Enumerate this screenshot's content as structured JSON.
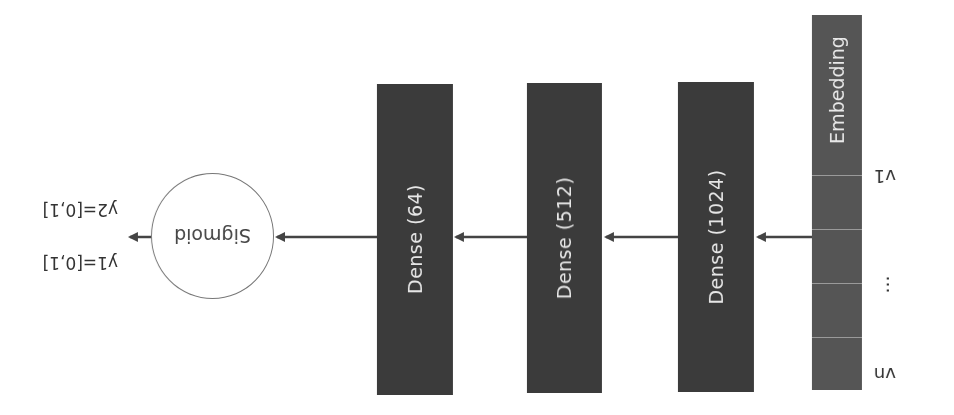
{
  "diagram": {
    "orientation": "rotated-180",
    "input": {
      "label": "Embedding",
      "tokens": [
        "v1",
        "…",
        "vn"
      ]
    },
    "layers": [
      {
        "label": "Dense (1024)"
      },
      {
        "label": "Dense (512)"
      },
      {
        "label": "Dense (64)"
      }
    ],
    "activation": {
      "label": "Sigmoid"
    },
    "outputs": [
      {
        "label": "y1=[0,1]"
      },
      {
        "label": "y2=[0,1]"
      }
    ],
    "colors": {
      "layer_fill": "#3b3b3b",
      "embedding_fill": "#555555",
      "arrow": "#444444",
      "text_light": "#e6e6e6"
    }
  }
}
